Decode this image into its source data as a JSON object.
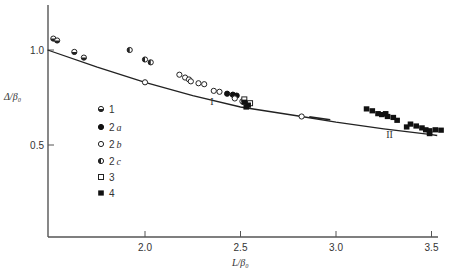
{
  "chart_data": {
    "type": "scatter",
    "title": "",
    "xlabel": "L/β0",
    "ylabel": "Δ/β0",
    "xlim": [
      1.49,
      3.53
    ],
    "ylim": [
      0.02,
      1.24
    ],
    "grid": false,
    "legend_position": "inside-left",
    "x_ticks": [
      {
        "value": 2.0,
        "label": "2.0"
      },
      {
        "value": 2.5,
        "label": "2.5"
      },
      {
        "value": 3.0,
        "label": "3.0"
      },
      {
        "value": 3.5,
        "label": "3.5"
      }
    ],
    "y_ticks": [
      {
        "value": 1.0,
        "label": "1.0"
      },
      {
        "value": 0.5,
        "label": "0.5"
      }
    ],
    "curve": {
      "name": "theory",
      "points": [
        {
          "x": 1.49,
          "y": 1.0
        },
        {
          "x": 1.75,
          "y": 0.91
        },
        {
          "x": 2.0,
          "y": 0.83
        },
        {
          "x": 2.25,
          "y": 0.76
        },
        {
          "x": 2.5,
          "y": 0.7
        },
        {
          "x": 2.82,
          "y": 0.65
        },
        {
          "x": 3.0,
          "y": 0.62
        },
        {
          "x": 3.25,
          "y": 0.585
        },
        {
          "x": 3.5,
          "y": 0.555
        },
        {
          "x": 3.53,
          "y": 0.55
        }
      ],
      "markers": [
        {
          "x": 2.0,
          "y": 0.83
        },
        {
          "x": 2.82,
          "y": 0.65
        }
      ],
      "tangent_segment": {
        "x1": 2.86,
        "y1": 0.648,
        "x2": 2.97,
        "y2": 0.633
      },
      "annotations": [
        {
          "text": "I",
          "x": 2.35,
          "y": 0.71
        },
        {
          "text": "II",
          "x": 3.28,
          "y": 0.535
        }
      ]
    },
    "series": [
      {
        "name": "1",
        "marker": "half-filled-circle-bottom",
        "points": [
          {
            "x": 1.52,
            "y": 1.06
          },
          {
            "x": 1.54,
            "y": 1.05
          },
          {
            "x": 1.63,
            "y": 0.99
          },
          {
            "x": 1.68,
            "y": 0.96
          }
        ]
      },
      {
        "name": "2a",
        "marker": "filled-circle",
        "points": [
          {
            "x": 2.43,
            "y": 0.77
          },
          {
            "x": 2.46,
            "y": 0.765
          },
          {
            "x": 2.48,
            "y": 0.76
          }
        ]
      },
      {
        "name": "2b",
        "marker": "open-circle",
        "points": [
          {
            "x": 2.18,
            "y": 0.87
          },
          {
            "x": 2.21,
            "y": 0.855
          },
          {
            "x": 2.23,
            "y": 0.845
          },
          {
            "x": 2.24,
            "y": 0.835
          },
          {
            "x": 2.28,
            "y": 0.825
          },
          {
            "x": 2.31,
            "y": 0.82
          },
          {
            "x": 2.36,
            "y": 0.785
          },
          {
            "x": 2.39,
            "y": 0.78
          },
          {
            "x": 2.47,
            "y": 0.745
          },
          {
            "x": 2.51,
            "y": 0.73
          }
        ]
      },
      {
        "name": "2c",
        "marker": "half-filled-circle-left",
        "points": [
          {
            "x": 1.92,
            "y": 1.0
          },
          {
            "x": 2.0,
            "y": 0.95
          },
          {
            "x": 2.03,
            "y": 0.935
          }
        ]
      },
      {
        "name": "3",
        "marker": "open-square",
        "points": [
          {
            "x": 2.52,
            "y": 0.74
          },
          {
            "x": 2.55,
            "y": 0.72
          }
        ]
      },
      {
        "name": "4",
        "marker": "filled-square",
        "points": [
          {
            "x": 2.52,
            "y": 0.725
          },
          {
            "x": 2.54,
            "y": 0.71
          },
          {
            "x": 2.53,
            "y": 0.7
          },
          {
            "x": 3.16,
            "y": 0.69
          },
          {
            "x": 3.19,
            "y": 0.68
          },
          {
            "x": 3.22,
            "y": 0.665
          },
          {
            "x": 3.24,
            "y": 0.66
          },
          {
            "x": 3.26,
            "y": 0.665
          },
          {
            "x": 3.27,
            "y": 0.65
          },
          {
            "x": 3.3,
            "y": 0.645
          },
          {
            "x": 3.32,
            "y": 0.63
          },
          {
            "x": 3.37,
            "y": 0.595
          },
          {
            "x": 3.39,
            "y": 0.61
          },
          {
            "x": 3.42,
            "y": 0.6
          },
          {
            "x": 3.45,
            "y": 0.59
          },
          {
            "x": 3.47,
            "y": 0.58
          },
          {
            "x": 3.49,
            "y": 0.575
          },
          {
            "x": 3.49,
            "y": 0.56
          },
          {
            "x": 3.52,
            "y": 0.58
          },
          {
            "x": 3.55,
            "y": 0.578
          }
        ]
      }
    ]
  },
  "labels": {
    "y_axis_title": "Δ/β₀",
    "x_axis_title": "L/β₀",
    "legend": [
      {
        "num": "1",
        "sub": ""
      },
      {
        "num": "2",
        "sub": "a"
      },
      {
        "num": "2",
        "sub": "b"
      },
      {
        "num": "2",
        "sub": "c"
      },
      {
        "num": "3",
        "sub": ""
      },
      {
        "num": "4",
        "sub": ""
      }
    ]
  }
}
